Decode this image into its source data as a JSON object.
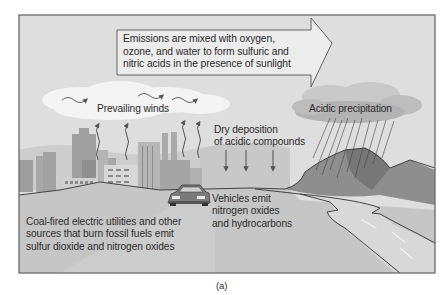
{
  "figure": {
    "caption": "(a)",
    "emissions_box": {
      "lines": [
        "Emissions are mixed with oxygen,",
        "ozone, and water to form sulfuric and",
        "nitric acids in the presence of sunlight"
      ]
    },
    "labels": {
      "prevailing_winds": "Prevailing winds",
      "dry_deposition": [
        "Dry deposition",
        "of acidic compounds"
      ],
      "acidic_precipitation": "Acidic precipitation",
      "vehicles": [
        "Vehicles emit",
        "nitrogen oxides",
        "and hydrocarbons"
      ],
      "coal": [
        "Coal-fired electric utilities and other",
        "sources that burn fossil fuels emit",
        "sulfur dioxide and nitrogen oxides"
      ]
    },
    "colors": {
      "sky": "#dcdcdc",
      "frame": "#6a6a6a",
      "cloud": "#f2f2f2",
      "rain_cloud": "#b9b9b9",
      "buildings": "#a9a9a9",
      "ground": "#c4c4c4",
      "mountain": "#8e8e8e",
      "river": "#d6d6d6",
      "text": "#2b2b2b"
    }
  }
}
